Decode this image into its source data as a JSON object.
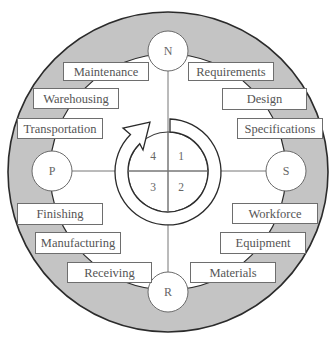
{
  "diagram": {
    "colors": {
      "ring_fill": "#c4c4c4",
      "outline": "#2b2b2b",
      "box_border": "#6e6e6e",
      "text": "#555555",
      "background": "#ffffff"
    },
    "nodes": {
      "top": "N",
      "right": "S",
      "bottom": "R",
      "left": "P"
    },
    "quadrants": {
      "q1": "1",
      "q2": "2",
      "q3": "3",
      "q4": "4"
    },
    "cycle_arrow": {
      "direction": "clockwise",
      "icon": "cycle-arrow-icon"
    },
    "labels": {
      "top_left": [
        "Maintenance",
        "Warehousing",
        "Transportation"
      ],
      "top_right": [
        "Requirements",
        "Design",
        "Specifications"
      ],
      "bottom_left": [
        "Finishing",
        "Manufacturing",
        "Receiving"
      ],
      "bottom_right": [
        "Workforce",
        "Equipment",
        "Materials"
      ]
    }
  }
}
